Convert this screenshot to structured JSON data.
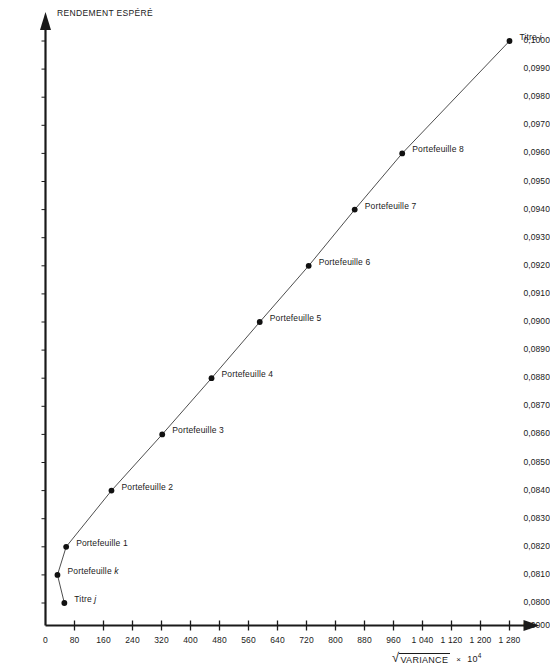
{
  "chart_data": {
    "type": "line",
    "title": "",
    "ylabel": "RENDEMENT ESPÉRÉ",
    "xlabel": "√VARIANCE × 10⁴",
    "xlabel_parts": {
      "radical": "√",
      "radicand": "VARIANCE",
      "times": "×",
      "factor": "10",
      "exponent": "4"
    },
    "xlim": [
      0,
      1280
    ],
    "ylim": [
      0.08,
      0.1
    ],
    "y_origin_label": "0,0000",
    "grid": false,
    "legend": "none",
    "xticks": [
      "0",
      "80",
      "160",
      "240",
      "320",
      "400",
      "480",
      "560",
      "640",
      "720",
      "800",
      "880",
      "960",
      "1 040",
      "1 120",
      "1 200",
      "1 280"
    ],
    "xtick_values": [
      0,
      80,
      160,
      240,
      320,
      400,
      480,
      560,
      640,
      720,
      800,
      880,
      960,
      1040,
      1120,
      1200,
      1280
    ],
    "yticks": [
      "0,1000",
      "0,0990",
      "0,0980",
      "0,0970",
      "0,0960",
      "0,0950",
      "0,0940",
      "0,0930",
      "0,0920",
      "0,0910",
      "0,0900",
      "0,0890",
      "0,0880",
      "0,0870",
      "0,0860",
      "0,0850",
      "0,0840",
      "0,0830",
      "0,0820",
      "0,0810",
      "0,0800",
      "0,0000"
    ],
    "ytick_values": [
      0.1,
      0.099,
      0.098,
      0.097,
      0.096,
      0.095,
      0.094,
      0.093,
      0.092,
      0.091,
      0.09,
      0.089,
      0.088,
      0.087,
      0.086,
      0.085,
      0.084,
      0.083,
      0.082,
      0.081,
      0.08,
      0.0
    ],
    "points": [
      {
        "label": "Titre j",
        "label_italic_tail": "j",
        "x": 52,
        "y": 0.08,
        "label_dx": 10,
        "label_dy": -3
      },
      {
        "label": "Portefeuille k",
        "label_italic_tail": "k",
        "x": 33,
        "y": 0.081,
        "label_dx": 10,
        "label_dy": -3
      },
      {
        "label": "Portefeuille 1",
        "label_italic_tail": "",
        "x": 57,
        "y": 0.082,
        "label_dx": 10,
        "label_dy": -3
      },
      {
        "label": "Portefeuille 2",
        "label_italic_tail": "",
        "x": 182,
        "y": 0.084,
        "label_dx": 10,
        "label_dy": -3
      },
      {
        "label": "Portefeuille 3",
        "label_italic_tail": "",
        "x": 322,
        "y": 0.086,
        "label_dx": 10,
        "label_dy": -3
      },
      {
        "label": "Portefeuille 4",
        "label_italic_tail": "",
        "x": 458,
        "y": 0.088,
        "label_dx": 10,
        "label_dy": -3
      },
      {
        "label": "Portefeuille 5",
        "label_italic_tail": "",
        "x": 591,
        "y": 0.09,
        "label_dx": 10,
        "label_dy": -3
      },
      {
        "label": "Portefeuille 6",
        "label_italic_tail": "",
        "x": 726,
        "y": 0.092,
        "label_dx": 10,
        "label_dy": -3
      },
      {
        "label": "Portefeuille 7",
        "label_italic_tail": "",
        "x": 853,
        "y": 0.094,
        "label_dx": 10,
        "label_dy": -3
      },
      {
        "label": "Portefeuille 8",
        "label_italic_tail": "",
        "x": 984,
        "y": 0.096,
        "label_dx": 10,
        "label_dy": -3
      },
      {
        "label": "Titre i",
        "label_italic_tail": "i",
        "x": 1280,
        "y": 0.1,
        "label_dx": 10,
        "label_dy": -3
      }
    ],
    "colors": {
      "axis": "#1a1a1a",
      "line": "#3a3a3a",
      "marker": "#111111",
      "background": "#ffffff"
    }
  }
}
